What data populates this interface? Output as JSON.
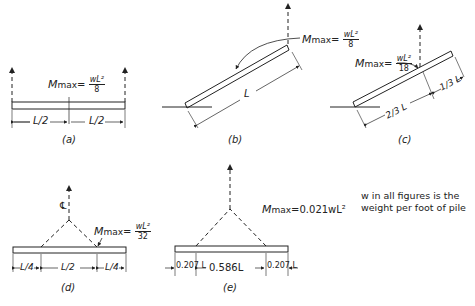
{
  "figures": {
    "a": {
      "caption": "(a)",
      "moment_label": "M",
      "moment_sub": "max",
      "eq": "=",
      "frac_num": "wL²",
      "frac_den": "8",
      "dims": [
        "L/2",
        "L/2"
      ]
    },
    "b": {
      "caption": "(b)",
      "moment_label": "M",
      "moment_sub": "max",
      "eq": "=",
      "frac_num": "wL²",
      "frac_den": "8",
      "length_label": "L"
    },
    "c": {
      "caption": "(c)",
      "moment_label": "M",
      "moment_sub": "max",
      "eq": "=",
      "frac_num": "wL²",
      "frac_den": "18",
      "dims": [
        "2/3 L",
        "1/3 L"
      ]
    },
    "d": {
      "caption": "(d)",
      "centerline": "℄",
      "moment_label": "M",
      "moment_sub": "max",
      "eq": "=",
      "frac_num": "wL²",
      "frac_den": "32",
      "dims": [
        "L/4",
        "L/2",
        "L/4"
      ]
    },
    "e": {
      "caption": "(e)",
      "moment_text": "M",
      "moment_sub": "max",
      "moment_value": "=0.021wL²",
      "dims": [
        "0.207 L",
        "0.586L",
        "0.207 L"
      ]
    }
  },
  "note": {
    "line1": "w in all figures is the",
    "line2": "weight per foot of pile"
  }
}
